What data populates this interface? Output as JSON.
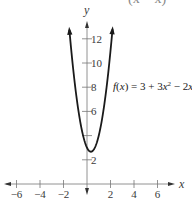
{
  "chart_data": {
    "type": "line",
    "title": "",
    "function_label": "f(x) = 3 + 3x² − 2x",
    "function_parts": {
      "f": "f",
      "open": "(",
      "x": "x",
      "close": ") = 3 + 3",
      "x2": "x",
      "sup": "2",
      "rest": " − 2",
      "x3": "x"
    },
    "equation": {
      "a": 3,
      "b": -2,
      "c": 3
    },
    "vertex": [
      0.333,
      2.667
    ],
    "xlabel": "x",
    "ylabel": "y",
    "xlim": [
      -7,
      7
    ],
    "ylim": [
      0,
      13
    ],
    "x_ticks": [
      -6,
      -4,
      -2,
      2,
      4,
      6
    ],
    "x_tick_labels": [
      "−6",
      "−4",
      "−2",
      "2",
      "4",
      "6"
    ],
    "y_ticks": [
      2,
      4,
      6,
      8,
      10,
      12
    ],
    "y_tick_labels": [
      "2",
      "",
      "6",
      "8",
      "10",
      "12"
    ],
    "grid": false,
    "curve_range": [
      -1.5,
      2.17
    ],
    "top_fragment": "(x − x)"
  },
  "colors": {
    "curve": "#1a1a1a",
    "axis": "#555555"
  }
}
